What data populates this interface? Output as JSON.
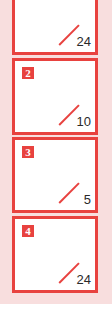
{
  "accent_color": "#e8423f",
  "background_color": "#f8dede",
  "cards": [
    {
      "badge": "1",
      "count": "24"
    },
    {
      "badge": "2",
      "count": "10"
    },
    {
      "badge": "3",
      "count": "5"
    },
    {
      "badge": "4",
      "count": "24"
    }
  ]
}
